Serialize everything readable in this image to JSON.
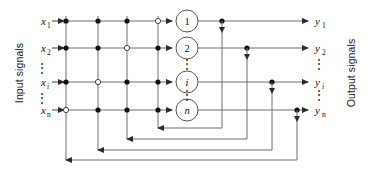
{
  "figure": {
    "kind": "recurrent-neural-network-architecture-diagram",
    "left_axis_label": "Input signals",
    "right_axis_label": "Output signals"
  },
  "inputs": [
    {
      "base": "x",
      "sub": "1",
      "sub_italic": false
    },
    {
      "base": "x",
      "sub": "2",
      "sub_italic": false
    },
    {
      "base": "x",
      "sub": "i",
      "sub_italic": true
    },
    {
      "base": "x",
      "sub": "n",
      "sub_italic": false
    }
  ],
  "outputs": [
    {
      "base": "y",
      "sub": "1",
      "sub_italic": false
    },
    {
      "base": "y",
      "sub": "2",
      "sub_italic": false
    },
    {
      "base": "y",
      "sub": "i",
      "sub_italic": true
    },
    {
      "base": "y",
      "sub": "n",
      "sub_italic": false
    }
  ],
  "neurons": [
    {
      "label": "1",
      "italic": false
    },
    {
      "label": "2",
      "italic": false
    },
    {
      "label": "i",
      "italic": true
    },
    {
      "label": "n",
      "italic": false
    }
  ],
  "ellipses": {
    "glyph": "⋮",
    "input_column": [
      "between-x2-and-xi",
      "between-xi-and-xn"
    ],
    "neuron_column": [
      "between-2-and-i",
      "between-i-and-n"
    ],
    "output_column": [
      "between-y2-and-yi",
      "between-yi-and-yn"
    ]
  },
  "grid": {
    "rows": 4,
    "columns": 4,
    "junction_types": [
      [
        "filled",
        "filled",
        "filled",
        "open"
      ],
      [
        "filled",
        "filled",
        "open",
        "filled"
      ],
      [
        "filled",
        "open",
        "filled",
        "filled"
      ],
      [
        "open",
        "filled",
        "filled",
        "filled"
      ]
    ],
    "legend": {
      "filled": "connected synapse junction",
      "open": "open (no self-connection) junction"
    }
  },
  "feedback": {
    "loop_count": 4,
    "direction": "right-to-left",
    "loops": [
      {
        "from_output_row": "1",
        "to_grid_column": 4
      },
      {
        "from_output_row": "2",
        "to_grid_column": 3
      },
      {
        "from_output_row": "i",
        "to_grid_column": 2
      },
      {
        "from_output_row": "n",
        "to_grid_column": 1
      }
    ]
  },
  "colors": {
    "wire": "#6e6e6e",
    "wire_dark": "#3c3c3c",
    "node_fill": "#ffffff",
    "node_stroke": "#555555",
    "dot_filled": "#111111",
    "text": "#111111",
    "background": "#ffffff"
  }
}
